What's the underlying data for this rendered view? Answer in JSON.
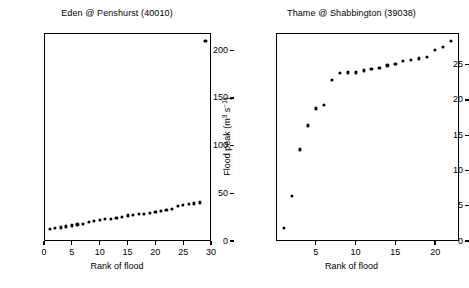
{
  "figure": {
    "background": "#ffffff",
    "marker_color": "#000000",
    "axis_color": "#000000"
  },
  "axis_titles": {
    "x": "Rank of flood",
    "y_prefix": "Flood peak (m",
    "y_sup1": "3",
    "y_mid": " s",
    "y_sup2": "−1",
    "y_suffix": ")"
  },
  "chart_data": [
    {
      "type": "scatter",
      "title": "Eden @ Penshurst (40010)",
      "xlabel": "Rank of flood",
      "ylabel": "Flood peak (m3 s-1)",
      "xlim": [
        0,
        30
      ],
      "ylim": [
        0,
        218
      ],
      "grid": false,
      "legend": null,
      "xticks": [
        0,
        5,
        10,
        15,
        20,
        25,
        30
      ],
      "yticks": [
        0,
        50,
        100,
        150,
        200
      ],
      "x": [
        1,
        2,
        3,
        4,
        5,
        6,
        7,
        8,
        9,
        10,
        11,
        12,
        13,
        14,
        15,
        16,
        17,
        18,
        19,
        20,
        21,
        22,
        23,
        24,
        25,
        26,
        27,
        28,
        29
      ],
      "y": [
        12.5,
        13.5,
        14.3,
        15.2,
        16.4,
        17.3,
        18.0,
        20.0,
        21.0,
        22.0,
        22.8,
        23.4,
        24.2,
        25.0,
        26.8,
        27.4,
        28.0,
        28.4,
        29.5,
        30.8,
        31.8,
        32.8,
        33.6,
        36.8,
        38.0,
        38.6,
        39.4,
        40.4,
        210.0
      ],
      "annotations": [
        "Single extreme outlier at rank 29 (~210 m3 s-1)"
      ]
    },
    {
      "type": "scatter",
      "title": "Thame @ Shabbington (39038)",
      "xlabel": "Rank of flood",
      "ylabel": "Flood peak (m3 s-1)",
      "xlim": [
        0,
        23
      ],
      "ylim": [
        0,
        29.5
      ],
      "grid": false,
      "legend": null,
      "xticks": [
        5,
        10,
        15,
        20
      ],
      "yticks": [
        0,
        5,
        10,
        15,
        20,
        25
      ],
      "x": [
        1,
        2,
        3,
        4,
        5,
        6,
        7,
        8,
        9,
        10,
        11,
        12,
        13,
        14,
        15,
        16,
        17,
        18,
        19,
        20,
        21,
        22
      ],
      "y": [
        1.8,
        6.4,
        13.0,
        16.4,
        18.8,
        19.3,
        22.8,
        23.8,
        23.9,
        23.9,
        24.2,
        24.4,
        24.6,
        24.9,
        25.1,
        25.5,
        25.7,
        25.9,
        26.1,
        27.1,
        27.5,
        28.4
      ],
      "annotations": [
        "Steep rise over first seven ranks then gradual plateau"
      ]
    }
  ]
}
